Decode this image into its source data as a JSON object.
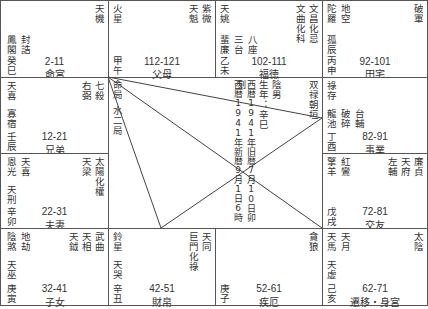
{
  "palaces": [
    {
      "id": "ming",
      "ages": "2-11",
      "name": "命宮",
      "stem": "癸巳",
      "main_stars": [
        "天機"
      ],
      "minor_right": [],
      "left_stars": [
        "封誥",
        "鳳閣"
      ]
    },
    {
      "id": "fumu",
      "ages": "112-121",
      "name": "父母",
      "stem": "甲午",
      "main_stars": [
        "紫微"
      ],
      "minor_right": [
        "天魁"
      ],
      "left_stars": [
        "火星"
      ]
    },
    {
      "id": "fude",
      "ages": "102-111",
      "name": "福徳",
      "stem": "乙未",
      "main_stars": [
        "文昌化忌"
      ],
      "minor_right": [
        "文曲化科"
      ],
      "left_stars": [
        "天姚"
      ],
      "left_lower": [
        "蜚廉",
        "三台",
        "八座"
      ]
    },
    {
      "id": "tianzhai",
      "ages": "92-101",
      "name": "田宅",
      "stem": "丙申",
      "main_stars": [
        "破軍"
      ],
      "minor_right": [],
      "left_stars": [
        "陀羅",
        "地空"
      ],
      "left_mid": [
        "孤辰"
      ]
    },
    {
      "id": "xiongdi",
      "ages": "12-21",
      "name": "兄弟",
      "stem": "壬辰",
      "main_stars": [
        "七殺"
      ],
      "minor_right": [
        "右弼"
      ],
      "left_stars": [
        "天喜"
      ],
      "left_mid": [
        "寡宿"
      ]
    },
    {
      "id": "shiye",
      "ages": "82-91",
      "name": "事業",
      "stem": "丁酉",
      "main_stars": [],
      "minor_right": [],
      "left_stars": [
        "祿存"
      ],
      "left_lower": [
        "龍池",
        "破碎",
        "台輔"
      ]
    },
    {
      "id": "fuqi",
      "ages": "22-31",
      "name": "夫妻",
      "stem": "辛卯",
      "main_stars": [
        "太陽化權"
      ],
      "minor_right": [
        "天梁"
      ],
      "left_stars": [
        "恩光",
        "天喜"
      ],
      "left_mid": [
        "天刑"
      ]
    },
    {
      "id": "jiaoyou",
      "ages": "72-81",
      "name": "交友",
      "stem": "戊戌",
      "main_stars": [
        "廉貞"
      ],
      "minor_right": [
        "天府",
        "左輔"
      ],
      "left_stars": [
        "擎羊",
        "紅鸞"
      ]
    },
    {
      "id": "zinv",
      "ages": "32-41",
      "name": "子女",
      "stem": "庚寅",
      "main_stars": [
        "武曲"
      ],
      "minor_right": [
        "天相",
        "天鉞"
      ],
      "left_stars": [
        "陰煞",
        "地劫"
      ],
      "left_mid": [
        "天巫"
      ]
    },
    {
      "id": "caibo",
      "ages": "42-51",
      "name": "財帛",
      "stem": "辛丑",
      "main_stars": [
        "天同"
      ],
      "minor_right": [
        "巨門化祿"
      ],
      "left_stars": [
        "鈴星"
      ],
      "left_mid": [
        "天哭"
      ]
    },
    {
      "id": "jie",
      "ages": "52-61",
      "name": "疾厄",
      "stem": "庚子",
      "main_stars": [
        "貪狼"
      ],
      "minor_right": [],
      "left_stars": []
    },
    {
      "id": "qianyi",
      "ages": "62-71",
      "name": "遷移・身宮",
      "stem": "己亥",
      "main_stars": [
        "太陰"
      ],
      "minor_right": [],
      "left_stars": [
        "天馬",
        "天月"
      ],
      "left_mid": [
        "天虚"
      ]
    }
  ],
  "center": {
    "ju_label": "命局",
    "ju": "水二局",
    "pattern": "双禄朝垣",
    "gender": "陰男",
    "birth_year": "生年：辛巳",
    "lunar": "西暦1941年旧暦7月10日卯刻",
    "solar": "西暦1941年新暦9月1日6時"
  },
  "colors": {
    "line": "#444444",
    "border": "#555555",
    "text": "#333333",
    "background": "#ffffff"
  }
}
